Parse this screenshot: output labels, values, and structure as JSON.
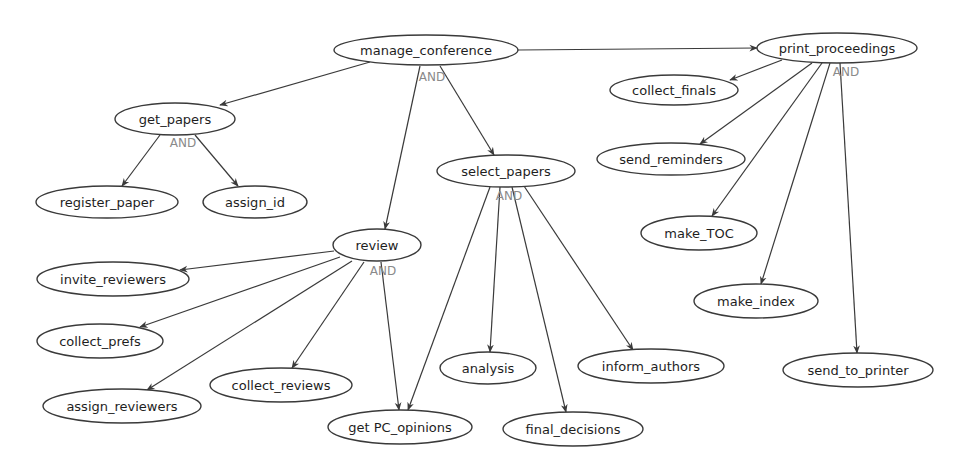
{
  "diagram": {
    "type": "goal-decomposition-tree",
    "colors": {
      "background": "#ffffff",
      "node_stroke": "#3a3a3a",
      "node_fill": "#ffffff",
      "text": "#1e1e1e",
      "edge": "#3a3a3a",
      "and_label": "#8a8a8a"
    },
    "nodes": [
      {
        "id": "manage_conference",
        "label": "manage_conference",
        "cx": 426,
        "cy": 50,
        "rx": 92,
        "ry": 15
      },
      {
        "id": "print_proceedings",
        "label": "print_proceedings",
        "cx": 837,
        "cy": 48,
        "rx": 80,
        "ry": 15
      },
      {
        "id": "get_papers",
        "label": "get_papers",
        "cx": 175,
        "cy": 119,
        "rx": 60,
        "ry": 16
      },
      {
        "id": "collect_finals",
        "label": "collect_finals",
        "cx": 674,
        "cy": 90,
        "rx": 64,
        "ry": 15
      },
      {
        "id": "register_paper",
        "label": "register_paper",
        "cx": 107,
        "cy": 202,
        "rx": 71,
        "ry": 16
      },
      {
        "id": "assign_id",
        "label": "assign_id",
        "cx": 255,
        "cy": 202,
        "rx": 52,
        "ry": 16
      },
      {
        "id": "select_papers",
        "label": "select_papers",
        "cx": 506,
        "cy": 171,
        "rx": 69,
        "ry": 16
      },
      {
        "id": "send_reminders",
        "label": "send_reminders",
        "cx": 671,
        "cy": 159,
        "rx": 74,
        "ry": 16
      },
      {
        "id": "make_TOC",
        "label": "make_TOC",
        "cx": 699,
        "cy": 233,
        "rx": 58,
        "ry": 17
      },
      {
        "id": "review",
        "label": "review",
        "cx": 377,
        "cy": 245,
        "rx": 44,
        "ry": 16
      },
      {
        "id": "invite_reviewers",
        "label": "invite_reviewers",
        "cx": 113,
        "cy": 279,
        "rx": 76,
        "ry": 17
      },
      {
        "id": "make_index",
        "label": "make_index",
        "cx": 756,
        "cy": 301,
        "rx": 62,
        "ry": 17
      },
      {
        "id": "collect_prefs",
        "label": "collect_prefs",
        "cx": 100,
        "cy": 341,
        "rx": 63,
        "ry": 17
      },
      {
        "id": "inform_authors",
        "label": "inform_authors",
        "cx": 651,
        "cy": 366,
        "rx": 73,
        "ry": 17
      },
      {
        "id": "analysis",
        "label": "analysis",
        "cx": 488,
        "cy": 368,
        "rx": 48,
        "ry": 16
      },
      {
        "id": "send_to_printer",
        "label": "send_to_printer",
        "cx": 858,
        "cy": 370,
        "rx": 75,
        "ry": 17
      },
      {
        "id": "collect_reviews",
        "label": "collect_reviews",
        "cx": 281,
        "cy": 385,
        "rx": 71,
        "ry": 17
      },
      {
        "id": "assign_reviewers",
        "label": "assign_reviewers",
        "cx": 122,
        "cy": 406,
        "rx": 79,
        "ry": 17
      },
      {
        "id": "get_PC_opinions",
        "label": "get PC_opinions",
        "cx": 400,
        "cy": 427,
        "rx": 72,
        "ry": 17
      },
      {
        "id": "final_decisions",
        "label": "final_decisions",
        "cx": 573,
        "cy": 429,
        "rx": 70,
        "ry": 17
      }
    ],
    "edges": [
      {
        "from": "manage_conference",
        "to": "print_proceedings",
        "x1": 518,
        "y1": 50,
        "x2": 757,
        "y2": 48
      },
      {
        "from": "manage_conference",
        "to": "get_papers",
        "x1": 370,
        "y1": 62,
        "x2": 220,
        "y2": 105
      },
      {
        "from": "manage_conference",
        "to": "review",
        "x1": 420,
        "y1": 66,
        "x2": 385,
        "y2": 229
      },
      {
        "from": "manage_conference",
        "to": "select_papers",
        "x1": 440,
        "y1": 66,
        "x2": 494,
        "y2": 155
      },
      {
        "from": "get_papers",
        "to": "register_paper",
        "x1": 160,
        "y1": 135,
        "x2": 122,
        "y2": 186
      },
      {
        "from": "get_papers",
        "to": "assign_id",
        "x1": 195,
        "y1": 135,
        "x2": 238,
        "y2": 186
      },
      {
        "from": "select_papers",
        "to": "get_PC_opinions",
        "x1": 490,
        "y1": 187,
        "x2": 408,
        "y2": 410
      },
      {
        "from": "select_papers",
        "to": "analysis",
        "x1": 500,
        "y1": 187,
        "x2": 490,
        "y2": 352
      },
      {
        "from": "select_papers",
        "to": "final_decisions",
        "x1": 512,
        "y1": 187,
        "x2": 566,
        "y2": 412
      },
      {
        "from": "select_papers",
        "to": "inform_authors",
        "x1": 524,
        "y1": 186,
        "x2": 633,
        "y2": 350
      },
      {
        "from": "review",
        "to": "invite_reviewers",
        "x1": 334,
        "y1": 251,
        "x2": 180,
        "y2": 270
      },
      {
        "from": "review",
        "to": "collect_prefs",
        "x1": 340,
        "y1": 257,
        "x2": 140,
        "y2": 327
      },
      {
        "from": "review",
        "to": "assign_reviewers",
        "x1": 352,
        "y1": 261,
        "x2": 147,
        "y2": 390
      },
      {
        "from": "review",
        "to": "collect_reviews",
        "x1": 364,
        "y1": 262,
        "x2": 292,
        "y2": 368
      },
      {
        "from": "review",
        "to": "get_PC_opinions",
        "x1": 381,
        "y1": 262,
        "x2": 399,
        "y2": 410
      },
      {
        "from": "print_proceedings",
        "to": "collect_finals",
        "x1": 782,
        "y1": 60,
        "x2": 730,
        "y2": 80
      },
      {
        "from": "print_proceedings",
        "to": "send_reminders",
        "x1": 812,
        "y1": 63,
        "x2": 700,
        "y2": 144
      },
      {
        "from": "print_proceedings",
        "to": "make_TOC",
        "x1": 822,
        "y1": 63,
        "x2": 712,
        "y2": 216
      },
      {
        "from": "print_proceedings",
        "to": "make_index",
        "x1": 830,
        "y1": 63,
        "x2": 761,
        "y2": 284
      },
      {
        "from": "print_proceedings",
        "to": "send_to_printer",
        "x1": 840,
        "y1": 63,
        "x2": 857,
        "y2": 353
      }
    ],
    "and_labels": [
      {
        "parent": "manage_conference",
        "text": "AND",
        "x": 432,
        "y": 77
      },
      {
        "parent": "get_papers",
        "text": "AND",
        "x": 183,
        "y": 143
      },
      {
        "parent": "select_papers",
        "text": "AND",
        "x": 509,
        "y": 196
      },
      {
        "parent": "review",
        "text": "AND",
        "x": 383,
        "y": 271
      },
      {
        "parent": "print_proceedings",
        "text": "AND",
        "x": 846,
        "y": 72
      }
    ]
  }
}
